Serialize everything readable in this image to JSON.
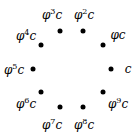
{
  "diagram": {
    "points": [
      {
        "label_base": "φ",
        "exp": "",
        "suffix": "c",
        "plain": "c",
        "dot": [
          111,
          69
        ],
        "text": [
          128,
          69
        ]
      },
      {
        "label_base": "φ",
        "exp": "",
        "suffix": "c",
        "plain": "φc",
        "dot": [
          103,
          45
        ],
        "text": [
          118,
          35
        ]
      },
      {
        "label_base": "φ",
        "exp": "2",
        "suffix": "c",
        "plain": "φ2c",
        "dot": [
          83,
          31
        ],
        "text": [
          84,
          14
        ]
      },
      {
        "label_base": "φ",
        "exp": "3",
        "suffix": "c",
        "plain": "φ3c",
        "dot": [
          60,
          31
        ],
        "text": [
          52,
          14
        ]
      },
      {
        "label_base": "φ",
        "exp": "4",
        "suffix": "c",
        "plain": "φ4c",
        "dot": [
          41,
          45
        ],
        "text": [
          26,
          35
        ]
      },
      {
        "label_base": "φ",
        "exp": "5",
        "suffix": "c",
        "plain": "φ5c",
        "dot": [
          33,
          69
        ],
        "text": [
          14,
          69
        ]
      },
      {
        "label_base": "φ",
        "exp": "6",
        "suffix": "c",
        "plain": "φ6c",
        "dot": [
          41,
          92
        ],
        "text": [
          26,
          103
        ]
      },
      {
        "label_base": "φ",
        "exp": "7",
        "suffix": "c",
        "plain": "φ7c",
        "dot": [
          60,
          107
        ],
        "text": [
          52,
          124
        ]
      },
      {
        "label_base": "φ",
        "exp": "8",
        "suffix": "c",
        "plain": "φ8c",
        "dot": [
          83,
          107
        ],
        "text": [
          84,
          124
        ]
      },
      {
        "label_base": "φ",
        "exp": "9",
        "suffix": "c",
        "plain": "φ9c",
        "dot": [
          103,
          92
        ],
        "text": [
          118,
          103
        ]
      }
    ]
  }
}
